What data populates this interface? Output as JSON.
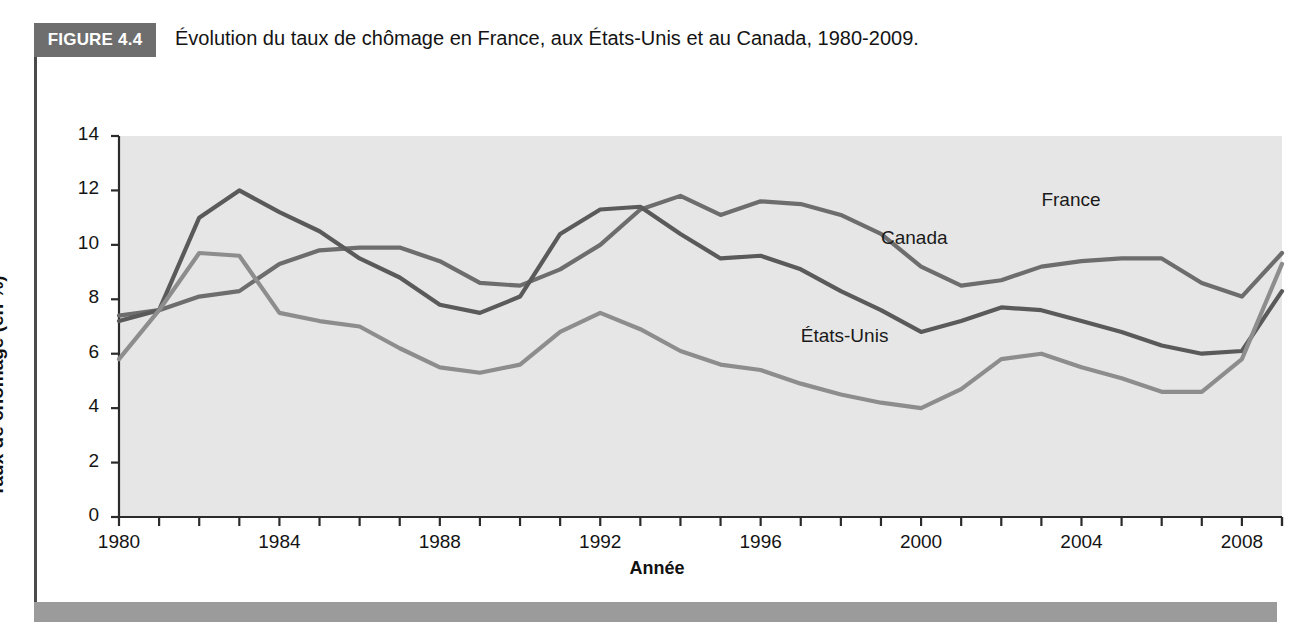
{
  "figure": {
    "badge": "FIGURE 4.4",
    "title": "Évolution du taux de chômage en France, aux États-Unis et au Canada, 1980-2009."
  },
  "colors": {
    "plot_background": "#e6e6e6",
    "badge_background": "#6e6e6e",
    "footer_bar": "#9b9b9b",
    "france_line": "#6d6d6d",
    "canada_line": "#5a5a5a",
    "etats_unis_line": "#8d8d8d",
    "axis": "#2b2b2b"
  },
  "chart_data": {
    "type": "line",
    "title": "Évolution du taux de chômage en France, aux États-Unis et au Canada, 1980-2009.",
    "xlabel": "Année",
    "ylabel": "Taux de chômage (en %)",
    "xlim": [
      1980,
      2009
    ],
    "ylim": [
      0,
      14
    ],
    "ytick_step": 2,
    "yticks": [
      0,
      2,
      4,
      6,
      8,
      10,
      12,
      14
    ],
    "xticks": [
      1980,
      1981,
      1982,
      1983,
      1984,
      1985,
      1986,
      1987,
      1988,
      1989,
      1990,
      1991,
      1992,
      1993,
      1994,
      1995,
      1996,
      1997,
      1998,
      1999,
      2000,
      2001,
      2002,
      2003,
      2004,
      2005,
      2006,
      2007,
      2008,
      2009
    ],
    "xtick_labels": [
      1980,
      1984,
      1988,
      1992,
      1996,
      2000,
      2004,
      2008
    ],
    "grid": false,
    "legend": "inline-labels",
    "x": [
      1980,
      1981,
      1982,
      1983,
      1984,
      1985,
      1986,
      1987,
      1988,
      1989,
      1990,
      1991,
      1992,
      1993,
      1994,
      1995,
      1996,
      1997,
      1998,
      1999,
      2000,
      2001,
      2002,
      2003,
      2004,
      2005,
      2006,
      2007,
      2008,
      2009
    ],
    "series": [
      {
        "name": "France",
        "color": "#6d6d6d",
        "label_x": 2003,
        "label_y": 11.6,
        "values": [
          7.4,
          7.6,
          8.1,
          8.3,
          9.3,
          9.8,
          9.9,
          9.9,
          9.4,
          8.6,
          8.5,
          9.1,
          10.0,
          11.3,
          11.8,
          11.1,
          11.6,
          11.5,
          11.1,
          10.4,
          9.2,
          8.5,
          8.7,
          9.2,
          9.4,
          9.5,
          9.5,
          8.6,
          8.1,
          9.7
        ]
      },
      {
        "name": "Canada",
        "color": "#5a5a5a",
        "label_x": 1999,
        "label_y": 10.2,
        "values": [
          7.2,
          7.6,
          11.0,
          12.0,
          11.2,
          10.5,
          9.5,
          8.8,
          7.8,
          7.5,
          8.1,
          10.4,
          11.3,
          11.4,
          10.4,
          9.5,
          9.6,
          9.1,
          8.3,
          7.6,
          6.8,
          7.2,
          7.7,
          7.6,
          7.2,
          6.8,
          6.3,
          6.0,
          6.1,
          8.3
        ]
      },
      {
        "name": "États-Unis",
        "color": "#8d8d8d",
        "label_x": 1997,
        "label_y": 6.6,
        "values": [
          5.8,
          7.6,
          9.7,
          9.6,
          7.5,
          7.2,
          7.0,
          6.2,
          5.5,
          5.3,
          5.6,
          6.8,
          7.5,
          6.9,
          6.1,
          5.6,
          5.4,
          4.9,
          4.5,
          4.2,
          4.0,
          4.7,
          5.8,
          6.0,
          5.5,
          5.1,
          4.6,
          4.6,
          5.8,
          9.3
        ]
      }
    ]
  },
  "axis_labels": {
    "y_title": "Taux de chômage (en %)",
    "x_title": "Année"
  }
}
